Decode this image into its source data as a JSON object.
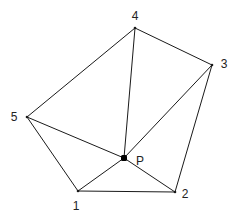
{
  "diagram": {
    "vertices": [
      {
        "id": "1",
        "label": "1",
        "x": 78,
        "y": 191,
        "lx": 76,
        "ly": 210
      },
      {
        "id": "2",
        "label": "2",
        "x": 175,
        "y": 192,
        "lx": 185,
        "ly": 198
      },
      {
        "id": "3",
        "label": "3",
        "x": 212,
        "y": 65,
        "lx": 224,
        "ly": 68
      },
      {
        "id": "4",
        "label": "4",
        "x": 135,
        "y": 28,
        "lx": 135,
        "ly": 20
      },
      {
        "id": "5",
        "label": "5",
        "x": 27,
        "y": 117,
        "lx": 14,
        "ly": 121
      }
    ],
    "center": {
      "id": "P",
      "label": "P",
      "x": 124,
      "y": 158,
      "lx": 140,
      "ly": 165
    },
    "polygon_edges": [
      [
        "1",
        "2"
      ],
      [
        "2",
        "3"
      ],
      [
        "3",
        "4"
      ],
      [
        "4",
        "5"
      ],
      [
        "5",
        "1"
      ]
    ],
    "spoke_edges": [
      [
        "P",
        "1"
      ],
      [
        "P",
        "2"
      ],
      [
        "P",
        "3"
      ],
      [
        "P",
        "4"
      ],
      [
        "P",
        "5"
      ]
    ],
    "colors": {
      "stroke": "#1a1a1a",
      "point": "#000000",
      "text": "#222222"
    }
  }
}
